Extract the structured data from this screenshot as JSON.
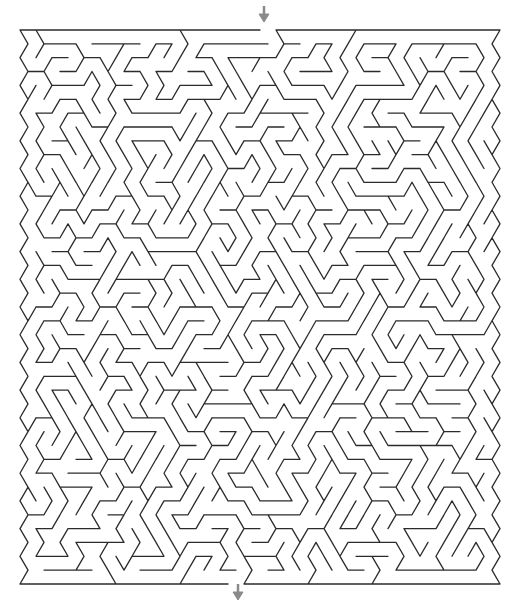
{
  "puzzle": {
    "type": "maze",
    "grid": "triangular",
    "start_marker": {
      "icon": "arrow-down-icon",
      "x": 264,
      "y": 6,
      "position": "top",
      "color": "#8a8a8a"
    },
    "end_marker": {
      "icon": "arrow-down-icon",
      "x": 238,
      "y": 584,
      "position": "bottom",
      "color": "#8a8a8a"
    },
    "wall_color": "#2b2b2b",
    "background": "#ffffff",
    "bounds": {
      "left": 20,
      "top": 30,
      "right": 496,
      "bottom": 579
    }
  }
}
